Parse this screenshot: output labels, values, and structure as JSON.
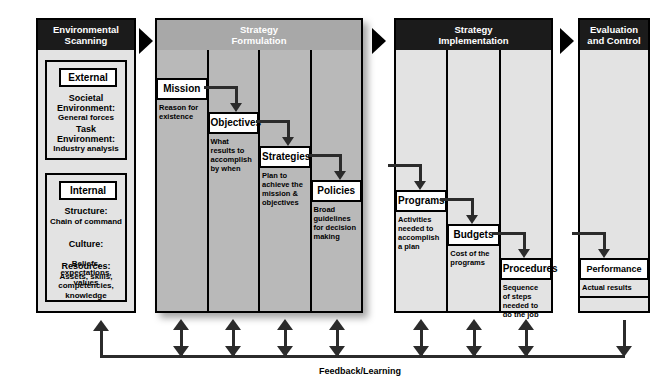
{
  "diagram": {
    "feedback_label": "Feedback/Learning"
  },
  "phases": {
    "environmental_scanning": {
      "header": "Environmental\nScanning",
      "external": {
        "label": "External",
        "items": [
          {
            "lead": "Societal",
            "lead2": "Environment:",
            "detail": "General forces"
          },
          {
            "lead": "Task",
            "lead2": "Environment:",
            "detail": "Industry analysis"
          }
        ]
      },
      "internal": {
        "label": "Internal",
        "items": [
          {
            "lead": "Structure:",
            "detail": "Chain of command"
          },
          {
            "lead": "Culture:",
            "detail": "Beliefs, expectations,\nvalues"
          },
          {
            "lead": "Resources:",
            "detail": "Assets, skills,\ncompetencies,\nknowledge"
          }
        ]
      }
    },
    "strategy_formulation": {
      "header": "Strategy\nFormulation",
      "steps": [
        {
          "title": "Mission",
          "desc": "Reason for\nexistence"
        },
        {
          "title": "Objectives",
          "desc": "What\nresults to\naccomplish\nby when"
        },
        {
          "title": "Strategies",
          "desc": "Plan to\nachieve the\nmission &\nobjectives"
        },
        {
          "title": "Policies",
          "desc": "Broad\nguidelines\nfor decision\nmaking"
        }
      ]
    },
    "strategy_implementation": {
      "header": "Strategy\nImplementation",
      "steps": [
        {
          "title": "Programs",
          "desc": "Activities\nneeded to\naccomplish\na plan"
        },
        {
          "title": "Budgets",
          "desc": "Cost of the\nprograms"
        },
        {
          "title": "Procedures",
          "desc": "Sequence\nof steps\nneeded to\ndo the job"
        }
      ]
    },
    "evaluation_and_control": {
      "header": "Evaluation\nand Control",
      "steps": [
        {
          "title": "Performance",
          "desc": "Actual results"
        }
      ]
    }
  }
}
